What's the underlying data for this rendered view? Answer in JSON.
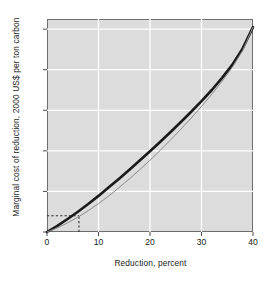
{
  "chart_data": {
    "type": "line",
    "title": "",
    "xlabel": "Reduction, percent",
    "ylabel": "Marginal cost of reduction, 2000 US$ per ton carbon",
    "xlim": [
      0,
      40
    ],
    "ylim": [
      0,
      105
    ],
    "xticks": [
      0,
      10,
      20,
      30,
      40
    ],
    "yticks": [
      0,
      20,
      40,
      60,
      80,
      100
    ],
    "xtick_labels": [
      "0",
      "10",
      "20",
      "30",
      "40"
    ],
    "ytick_labels": [
      "0",
      "20",
      "40",
      "60",
      "80",
      "100"
    ],
    "grid": true,
    "grid_color": "#ffffff",
    "plot_background": "#dcdcdc",
    "legend": "none",
    "series": [
      {
        "name": "marginal-cost-curve-thick",
        "style": "solid",
        "color": "#1a1a1a",
        "width": 2.6,
        "x": [
          0,
          2,
          4,
          6,
          8,
          10,
          12,
          14,
          16,
          18,
          20,
          22,
          24,
          26,
          28,
          30,
          32,
          34,
          36,
          38,
          40
        ],
        "y": [
          0,
          3.0,
          6.4,
          10.0,
          13.8,
          17.8,
          22.0,
          26.3,
          30.7,
          35.2,
          39.8,
          44.5,
          49.3,
          54.2,
          59.3,
          64.5,
          70.0,
          76.0,
          82.5,
          90.5,
          101.0
        ]
      },
      {
        "name": "marginal-cost-curve-thin",
        "style": "solid",
        "color": "#8a8a8a",
        "width": 1.0,
        "x": [
          0,
          2,
          4,
          6,
          8,
          10,
          12,
          14,
          16,
          18,
          20,
          22,
          24,
          26,
          28,
          30,
          32,
          34,
          36,
          38,
          40
        ],
        "y": [
          0,
          2.0,
          4.5,
          7.3,
          10.5,
          14.0,
          17.8,
          21.9,
          26.2,
          30.7,
          35.4,
          40.3,
          45.4,
          50.7,
          56.2,
          61.9,
          67.9,
          74.3,
          81.2,
          89.5,
          101.0
        ]
      }
    ],
    "annotations": [
      {
        "name": "reference-line-horizontal",
        "style": "dashed",
        "color": "#2b2b2b",
        "y": 8.0,
        "x_from": 0,
        "x_to": 6.2
      },
      {
        "name": "reference-line-vertical",
        "style": "dashed",
        "color": "#2b2b2b",
        "x": 6.2,
        "y_from": 0,
        "y_to": 8.0
      }
    ]
  }
}
